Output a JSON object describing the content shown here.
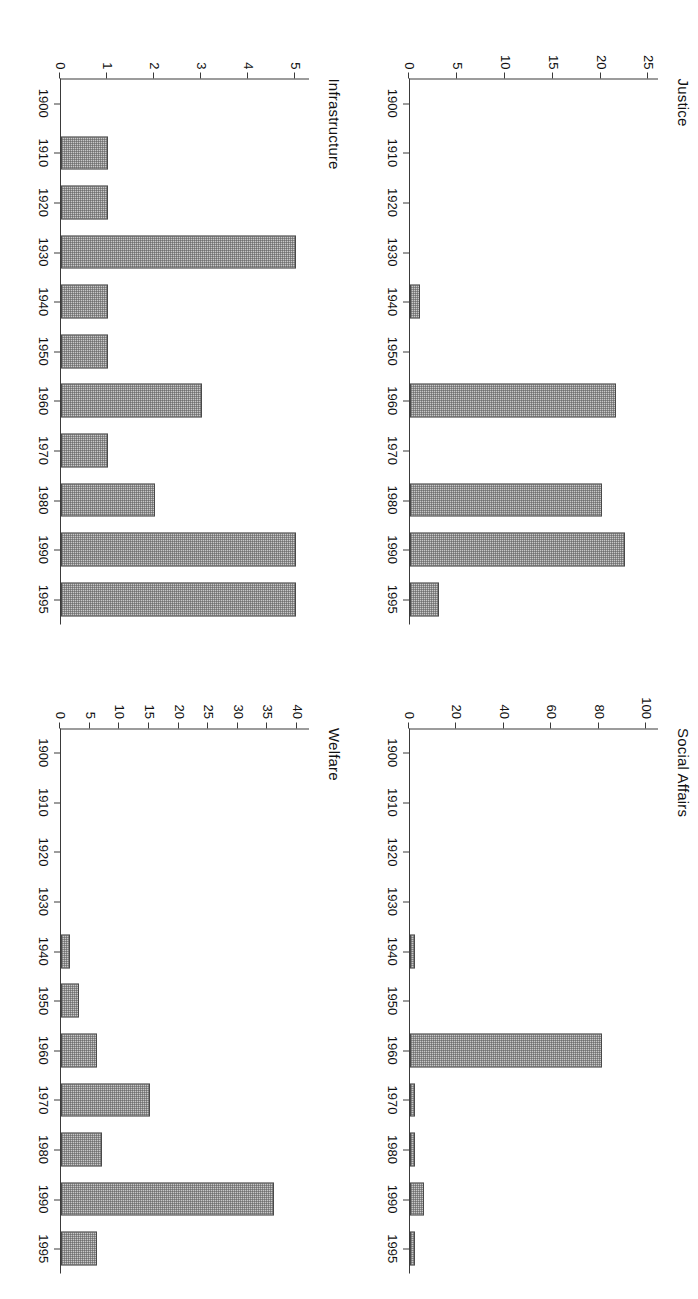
{
  "figure": {
    "layout": "2x2 grid of bar charts, page rotated 90 degrees",
    "background": "#ffffff",
    "bar_fill": "#c8c8c8",
    "bar_edge": "#4a4a4a",
    "axis_color": "#3a3a3a"
  },
  "charts": [
    {
      "id": "social-affairs",
      "title": "Social Affairs",
      "type": "bar",
      "xlabel": "",
      "ylabel": "",
      "categories": [
        "1900",
        "1910",
        "1920",
        "1930",
        "1940",
        "1950",
        "1960",
        "1970",
        "1980",
        "1990",
        "1995"
      ],
      "tick_labels": [
        "1900",
        "1910",
        "1920",
        "1930",
        "1940",
        "1950",
        "1960",
        "1970",
        "1980",
        "1990",
        "1995"
      ],
      "ytick_labels": [
        "0",
        "20",
        "40",
        "60",
        "80",
        "100"
      ],
      "yticks": [
        0,
        20,
        40,
        60,
        80,
        100
      ],
      "ylim": [
        0,
        105
      ],
      "grid": false,
      "legend": "none",
      "bars": [
        {
          "x": "1900",
          "value": 0
        },
        {
          "x": "1910",
          "value": 0
        },
        {
          "x": "1920",
          "value": 0
        },
        {
          "x": "1930",
          "value": 0
        },
        {
          "x": "1940",
          "value": 2
        },
        {
          "x": "1950",
          "value": 0
        },
        {
          "x": "1960",
          "value": 81
        },
        {
          "x": "1970",
          "value": 2
        },
        {
          "x": "1980",
          "value": 2
        },
        {
          "x": "1990",
          "value": 6
        },
        {
          "x": "1995",
          "value": 2
        }
      ],
      "values": [
        0,
        0,
        0,
        0,
        2,
        0,
        81,
        2,
        2,
        6,
        2
      ]
    },
    {
      "id": "welfare",
      "title": "Welfare",
      "type": "bar",
      "xlabel": "",
      "ylabel": "",
      "categories": [
        "1900",
        "1910",
        "1920",
        "1930",
        "1940",
        "1950",
        "1960",
        "1970",
        "1980",
        "1990",
        "1995"
      ],
      "tick_labels": [
        "1900",
        "1910",
        "1920",
        "1930",
        "1940",
        "1950",
        "1960",
        "1970",
        "1980",
        "1990",
        "1995"
      ],
      "ytick_labels": [
        "0",
        "5",
        "10",
        "15",
        "20",
        "25",
        "30",
        "35",
        "40"
      ],
      "yticks": [
        0,
        5,
        10,
        15,
        20,
        25,
        30,
        35,
        40
      ],
      "ylim": [
        0,
        42
      ],
      "grid": false,
      "legend": "none",
      "bars": [
        {
          "x": "1900",
          "value": 0
        },
        {
          "x": "1910",
          "value": 0
        },
        {
          "x": "1920",
          "value": 0
        },
        {
          "x": "1930",
          "value": 0
        },
        {
          "x": "1940",
          "value": 1.5
        },
        {
          "x": "1950",
          "value": 3
        },
        {
          "x": "1960",
          "value": 6
        },
        {
          "x": "1970",
          "value": 15
        },
        {
          "x": "1980",
          "value": 7
        },
        {
          "x": "1990",
          "value": 36
        },
        {
          "x": "1995",
          "value": 6
        }
      ],
      "values": [
        0,
        0,
        0,
        0,
        1.5,
        3,
        6,
        15,
        7,
        36,
        6
      ]
    },
    {
      "id": "justice",
      "title": "Justice",
      "type": "bar",
      "xlabel": "",
      "ylabel": "",
      "categories": [
        "1900",
        "1910",
        "1920",
        "1930",
        "1940",
        "1950",
        "1960",
        "1970",
        "1980",
        "1990",
        "1995"
      ],
      "tick_labels": [
        "1900",
        "1910",
        "1920",
        "1930",
        "1940",
        "1950",
        "1960",
        "1970",
        "1980",
        "1990",
        "1995"
      ],
      "ytick_labels": [
        "0",
        "5",
        "10",
        "15",
        "20",
        "25"
      ],
      "yticks": [
        0,
        5,
        10,
        15,
        20,
        25
      ],
      "ylim": [
        0,
        26
      ],
      "grid": false,
      "legend": "none",
      "bars": [
        {
          "x": "1900",
          "value": 0
        },
        {
          "x": "1910",
          "value": 0
        },
        {
          "x": "1920",
          "value": 0
        },
        {
          "x": "1930",
          "value": 0
        },
        {
          "x": "1940",
          "value": 1
        },
        {
          "x": "1950",
          "value": 0
        },
        {
          "x": "1960",
          "value": 21.5
        },
        {
          "x": "1970",
          "value": 0
        },
        {
          "x": "1980",
          "value": 20
        },
        {
          "x": "1990",
          "value": 22.5
        },
        {
          "x": "1995",
          "value": 3
        }
      ],
      "values": [
        0,
        0,
        0,
        0,
        1,
        0,
        21.5,
        0,
        20,
        22.5,
        3
      ]
    },
    {
      "id": "infrastructure",
      "title": "Infrastructure",
      "type": "bar",
      "xlabel": "",
      "ylabel": "",
      "categories": [
        "1900",
        "1910",
        "1920",
        "1930",
        "1940",
        "1950",
        "1960",
        "1970",
        "1980",
        "1990",
        "1995"
      ],
      "tick_labels": [
        "1900",
        "1910",
        "1920",
        "1930",
        "1940",
        "1950",
        "1960",
        "1970",
        "1980",
        "1990",
        "1995"
      ],
      "ytick_labels": [
        "0",
        "1",
        "2",
        "3",
        "4",
        "5"
      ],
      "yticks": [
        0,
        1,
        2,
        3,
        4,
        5
      ],
      "ylim": [
        0,
        5.3
      ],
      "grid": false,
      "legend": "none",
      "bars": [
        {
          "x": "1900",
          "value": 0
        },
        {
          "x": "1910",
          "value": 1
        },
        {
          "x": "1920",
          "value": 1
        },
        {
          "x": "1930",
          "value": 5
        },
        {
          "x": "1940",
          "value": 1
        },
        {
          "x": "1950",
          "value": 1
        },
        {
          "x": "1960",
          "value": 3
        },
        {
          "x": "1970",
          "value": 1
        },
        {
          "x": "1980",
          "value": 2
        },
        {
          "x": "1990",
          "value": 5
        },
        {
          "x": "1995",
          "value": 5
        }
      ],
      "values": [
        0,
        1,
        1,
        5,
        1,
        1,
        3,
        1,
        2,
        5,
        5
      ]
    }
  ],
  "chart_data": {
    "type": "bar",
    "title": "",
    "panels": [
      "Social Affairs",
      "Welfare",
      "Justice",
      "Infrastructure"
    ],
    "categories": [
      "1900",
      "1910",
      "1920",
      "1930",
      "1940",
      "1950",
      "1960",
      "1970",
      "1980",
      "1990",
      "1995"
    ],
    "xlabel": "",
    "ylabel": "",
    "grid": false,
    "legend": "none",
    "series": [
      {
        "name": "Social Affairs",
        "ylim": [
          0,
          105
        ],
        "yticks": [
          0,
          20,
          40,
          60,
          80,
          100
        ],
        "values": [
          0,
          0,
          0,
          0,
          2,
          0,
          81,
          2,
          2,
          6,
          2
        ]
      },
      {
        "name": "Welfare",
        "ylim": [
          0,
          42
        ],
        "yticks": [
          0,
          5,
          10,
          15,
          20,
          25,
          30,
          35,
          40
        ],
        "values": [
          0,
          0,
          0,
          0,
          1.5,
          3,
          6,
          15,
          7,
          36,
          6
        ]
      },
      {
        "name": "Justice",
        "ylim": [
          0,
          26
        ],
        "yticks": [
          0,
          5,
          10,
          15,
          20,
          25
        ],
        "values": [
          0,
          0,
          0,
          0,
          1,
          0,
          21.5,
          0,
          20,
          22.5,
          3
        ]
      },
      {
        "name": "Infrastructure",
        "ylim": [
          0,
          5.3
        ],
        "yticks": [
          0,
          1,
          2,
          3,
          4,
          5
        ],
        "values": [
          0,
          1,
          1,
          5,
          1,
          1,
          3,
          1,
          2,
          5,
          5
        ]
      }
    ]
  }
}
